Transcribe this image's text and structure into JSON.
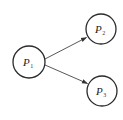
{
  "diagram": {
    "type": "directed-graph",
    "nodes": [
      {
        "id": "P1",
        "label": "P",
        "subscript": "1",
        "cx": 29,
        "cy": 62,
        "r": 16
      },
      {
        "id": "P2",
        "label": "P",
        "subscript": "2",
        "cx": 101,
        "cy": 29,
        "r": 15
      },
      {
        "id": "P3",
        "label": "P",
        "subscript": "3",
        "cx": 102,
        "cy": 91,
        "r": 15
      }
    ],
    "edges": [
      {
        "from": "P1",
        "to": "P2"
      },
      {
        "from": "P1",
        "to": "P3"
      }
    ],
    "colors": {
      "stroke": "#2a2a2a",
      "edge": "#444444",
      "background": "#ffffff"
    }
  }
}
